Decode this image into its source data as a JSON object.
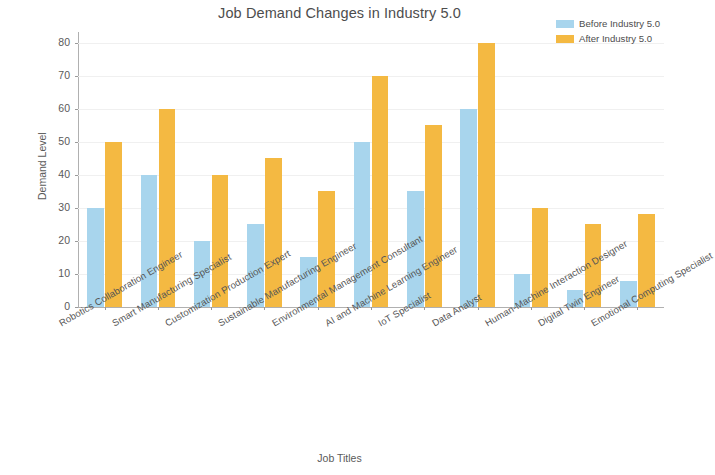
{
  "chart_data": {
    "type": "bar",
    "title": "Job Demand Changes in Industry 5.0",
    "xlabel": "Job Titles",
    "ylabel": "Demand Level",
    "ylim": [
      0,
      82
    ],
    "yticks": [
      0,
      10,
      20,
      30,
      40,
      50,
      60,
      70,
      80
    ],
    "grid": true,
    "legend_position": "upper right",
    "categories": [
      "Robotics Collaboration Engineer",
      "Smart Manufacturing Specialist",
      "Customization Production Expert",
      "Sustainable Manufacturing Engineer",
      "Environmental Management Consultant",
      "AI and Machine Learning Engineer",
      "IoT Specialist",
      "Data Analyst",
      "Human-Machine Interaction Designer",
      "Digital Twin Engineer",
      "Emotional Computing Specialist"
    ],
    "series": [
      {
        "name": "Before Industry 5.0",
        "color": "#a8d5ed",
        "values": [
          30,
          40,
          20,
          25,
          15,
          50,
          35,
          60,
          10,
          5,
          8
        ]
      },
      {
        "name": "After Industry 5.0",
        "color": "#f4b942",
        "values": [
          50,
          60,
          40,
          45,
          35,
          70,
          55,
          80,
          30,
          25,
          28
        ]
      }
    ]
  },
  "colors": {
    "before": "#a8d5ed",
    "after": "#f4b942",
    "axis": "#b0b0b0",
    "grid": "#f0f0f0",
    "text": "#4d4d4d",
    "background": "#ffffff"
  }
}
